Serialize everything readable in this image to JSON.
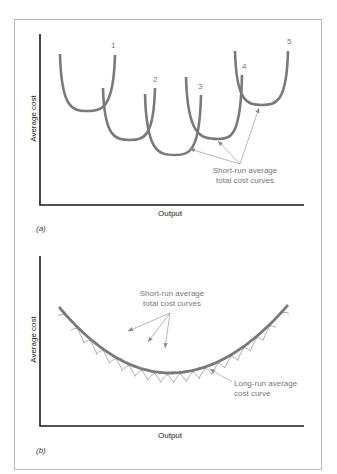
{
  "chart_data": [
    {
      "panel": "(a)",
      "type": "line",
      "xlabel": "Output",
      "ylabel": "Average cost",
      "grid": false,
      "series": [
        {
          "name": "1",
          "points": [
            [
              60,
              54
            ],
            [
              87,
              111
            ],
            [
              115,
              55
            ]
          ],
          "label_pos": [
            112,
            42
          ]
        },
        {
          "name": "2",
          "points": [
            [
              103,
              88
            ],
            [
              130,
              140
            ],
            [
              155,
              88
            ]
          ],
          "label_pos": [
            153,
            76
          ]
        },
        {
          "name": "3",
          "points": [
            [
              145,
              94
            ],
            [
              175,
              155
            ],
            [
              201,
              95
            ]
          ],
          "label_pos": [
            198,
            83
          ]
        },
        {
          "name": "4",
          "points": [
            [
              186,
              77
            ],
            [
              218,
              139
            ],
            [
              242,
              75
            ]
          ],
          "label_pos": [
            242,
            63
          ]
        },
        {
          "name": "5",
          "points": [
            [
              235,
              51
            ],
            [
              262,
              105
            ],
            [
              288,
              51
            ]
          ],
          "label_pos": [
            287,
            38
          ]
        }
      ],
      "annotation": {
        "text_lines": [
          "Short-run average",
          "total cost curves"
        ],
        "text_pos": [
          245,
          166
        ],
        "arrow_origin": [
          240,
          164
        ],
        "arrow_targets": [
          [
            190,
            149
          ],
          [
            218,
            141
          ],
          [
            259,
            108
          ]
        ]
      },
      "axes": {
        "origin": [
          40,
          205
        ],
        "x_end": 304,
        "y_top": 34
      }
    },
    {
      "panel": "(b)",
      "type": "line",
      "xlabel": "Output",
      "ylabel": "Average cost",
      "grid": false,
      "long_run": {
        "name": "Long-run average cost curve",
        "start": [
          59,
          307
        ],
        "min": [
          170,
          373
        ],
        "end": [
          288,
          305
        ]
      },
      "short_run_count": 17,
      "annotation_short": {
        "text_lines": [
          "Short-run average",
          "total cost curves"
        ],
        "text_pos": [
          172,
          289
        ],
        "arrow_origin": [
          170,
          313
        ],
        "arrow_targets": [
          [
            128,
            331
          ],
          [
            148,
            342
          ],
          [
            165,
            348
          ]
        ]
      },
      "annotation_long": {
        "text_lines": [
          "Long-run average",
          "cost curve"
        ],
        "text_pos": [
          234,
          379
        ],
        "arrow_origin": [
          232,
          382
        ],
        "arrow_targets": [
          [
            210,
            369
          ]
        ]
      },
      "axes": {
        "origin": [
          40,
          426
        ],
        "x_end": 304,
        "y_top": 256
      }
    }
  ],
  "labels": {
    "a_xlabel": "Output",
    "a_ylabel": "Average cost",
    "a_tag": "(a)",
    "a_note_1": "Short-run average",
    "a_note_2": "total cost curves",
    "b_xlabel": "Output",
    "b_ylabel": "Average cost",
    "b_tag": "(b)",
    "b_note_short_1": "Short-run average",
    "b_note_short_2": "total cost curves",
    "b_note_long_1": "Long-run average",
    "b_note_long_2": "cost curve",
    "n1": "1",
    "n2": "2",
    "n3": "3",
    "n4": "4",
    "n5": "5"
  },
  "colors": {
    "axis": "#1a1a1a",
    "curve": "#7a7a7a",
    "thin_curve": "#8a8a8a",
    "annotation": "#8a8a8a",
    "frame": "#b9b9b9"
  }
}
